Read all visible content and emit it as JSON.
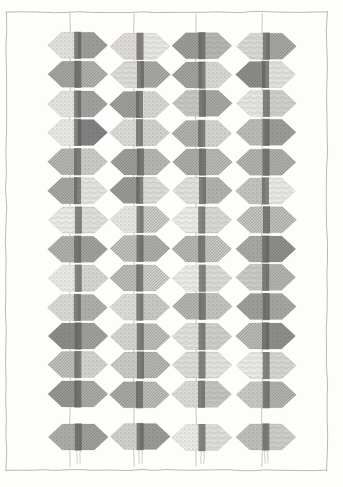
{
  "figure": {
    "background_color": "#fdfdfc",
    "frame_color": "#b9b9b5",
    "column_line_color": "#cfcfca",
    "spine_color": "#5c5c5c",
    "rows": 14,
    "columns": 4,
    "frame": {
      "left": 6,
      "top": 12,
      "right": 327,
      "bottom": 470
    },
    "column_x": [
      78,
      140,
      202,
      266
    ],
    "column_line_x": [
      70,
      134,
      196,
      262
    ],
    "row_y": [
      46,
      75,
      104,
      133,
      162,
      191,
      220,
      249,
      278,
      307,
      336,
      365,
      394,
      437
    ],
    "hex_width": 60,
    "hex_height": 26,
    "hex_notch": 14,
    "spine_width": 7
  },
  "chart_data": {
    "type": "heatmap",
    "xlabel": "",
    "ylabel": "",
    "columns": [
      "C1",
      "C2",
      "C3",
      "C4"
    ],
    "rows": [
      "R1",
      "R2",
      "R3",
      "R4",
      "R5",
      "R6",
      "R7",
      "R8",
      "R9",
      "R10",
      "R11",
      "R12",
      "R13",
      "R14"
    ],
    "legend": [],
    "grid": true,
    "note": "Each cell is a hexagonal block split into a left half and a right half; each half has its own grey tone and stipple/hatch texture. A dark vertical spine runs down the middle of every block.",
    "cells": [
      [
        {
          "left_tone": "#e0e0dd",
          "right_tone": "#9b9b98",
          "left_tex": "stipple",
          "right_tex": "stipple"
        },
        {
          "left_tone": "#dedbd6",
          "right_tone": "#e8e8e5",
          "left_tex": "stipple",
          "right_tex": "wave"
        },
        {
          "left_tone": "#9d9d9a",
          "right_tone": "#b5b5b1",
          "left_tex": "hatch",
          "right_tex": "wave"
        },
        {
          "left_tone": "#d9d9d5",
          "right_tone": "#a7a7a3",
          "left_tex": "wave",
          "right_tex": "hatch"
        }
      ],
      [
        {
          "left_tone": "#a5a5a1",
          "right_tone": "#b0b0ac",
          "left_tex": "hatch",
          "right_tex": "hatch"
        },
        {
          "left_tone": "#dcdcd8",
          "right_tone": "#a9a9a5",
          "left_tex": "wave",
          "right_tex": "hatch"
        },
        {
          "left_tone": "#a3a3a0",
          "right_tone": "#d6d6d2",
          "left_tex": "hatch",
          "right_tex": "stipple"
        },
        {
          "left_tone": "#8d8d8a",
          "right_tone": "#e2e2df",
          "left_tex": "hatch",
          "right_tex": "wave"
        }
      ],
      [
        {
          "left_tone": "#e3e3e0",
          "right_tone": "#a0a09d",
          "left_tex": "stipple",
          "right_tex": "stipple"
        },
        {
          "left_tone": "#9f9f9b",
          "right_tone": "#d5d5d1",
          "left_tex": "hatch",
          "right_tex": "stipple"
        },
        {
          "left_tone": "#c6c6c2",
          "right_tone": "#a8a8a4",
          "left_tex": "wave",
          "right_tex": "hatch"
        },
        {
          "left_tone": "#e6e6e3",
          "right_tone": "#cfcfcb",
          "left_tex": "wave",
          "right_tex": "wave"
        }
      ],
      [
        {
          "left_tone": "#e7e7e4",
          "right_tone": "#808080",
          "left_tex": "stipple",
          "right_tex": "stipple"
        },
        {
          "left_tone": "#dadad6",
          "right_tone": "#d0d0cc",
          "left_tex": "stipple",
          "right_tex": "stipple"
        },
        {
          "left_tone": "#b2b2ae",
          "right_tone": "#d2d2ce",
          "left_tex": "hatch",
          "right_tex": "stipple"
        },
        {
          "left_tone": "#b8b8b4",
          "right_tone": "#9a9a97",
          "left_tex": "stipple",
          "right_tex": "stipple"
        }
      ],
      [
        {
          "left_tone": "#b6b6b2",
          "right_tone": "#c9c9c5",
          "left_tex": "hatch",
          "right_tex": "stipple"
        },
        {
          "left_tone": "#9e9e9b",
          "right_tone": "#b4b4b0",
          "left_tex": "hatch",
          "right_tex": "stipple"
        },
        {
          "left_tone": "#adadaa",
          "right_tone": "#b9b9b5",
          "left_tex": "hatch",
          "right_tex": "hatch"
        },
        {
          "left_tone": "#b3b3af",
          "right_tone": "#aeaeaa",
          "left_tex": "hatch",
          "right_tex": "hatch"
        }
      ],
      [
        {
          "left_tone": "#a8a8a4",
          "right_tone": "#e4e4e1",
          "left_tex": "hatch",
          "right_tex": "wave"
        },
        {
          "left_tone": "#9a9a97",
          "right_tone": "#dcdcd8",
          "left_tex": "hatch",
          "right_tex": "wave"
        },
        {
          "left_tone": "#e1e1de",
          "right_tone": "#b0b0ac",
          "left_tex": "wave",
          "right_tex": "stipple"
        },
        {
          "left_tone": "#c2c2be",
          "right_tone": "#e9e9e6",
          "left_tex": "stipple",
          "right_tex": "wave"
        }
      ],
      [
        {
          "left_tone": "#eaeae7",
          "right_tone": "#dfdfdc",
          "left_tex": "wave",
          "right_tex": "wave"
        },
        {
          "left_tone": "#e5e5e2",
          "right_tone": "#cbcbc7",
          "left_tex": "stipple",
          "right_tex": "hatch"
        },
        {
          "left_tone": "#ececea",
          "right_tone": "#d8d8d4",
          "left_tex": "wave",
          "right_tex": "wave"
        },
        {
          "left_tone": "#c4c4c0",
          "right_tone": "#bebeba",
          "left_tex": "hatch",
          "right_tex": "hatch"
        }
      ],
      [
        {
          "left_tone": "#b1b1ad",
          "right_tone": "#a2a29f",
          "left_tex": "hatch",
          "right_tex": "hatch"
        },
        {
          "left_tone": "#c0c0bc",
          "right_tone": "#aeaeaa",
          "left_tex": "hatch",
          "right_tex": "hatch"
        },
        {
          "left_tone": "#b7b7b3",
          "right_tone": "#c5c5c1",
          "left_tex": "hatch",
          "right_tex": "hatch"
        },
        {
          "left_tone": "#a6a6a2",
          "right_tone": "#8f8f8c",
          "left_tex": "stipple",
          "right_tex": "hatch"
        }
      ],
      [
        {
          "left_tone": "#e8e8e5",
          "right_tone": "#d4d4d0",
          "left_tex": "stipple",
          "right_tex": "stipple"
        },
        {
          "left_tone": "#bcbcb8",
          "right_tone": "#cdcdc9",
          "left_tex": "hatch",
          "right_tex": "hatch"
        },
        {
          "left_tone": "#ebebe8",
          "right_tone": "#dadad7",
          "left_tex": "wave",
          "right_tex": "wave"
        },
        {
          "left_tone": "#cacac6",
          "right_tone": "#b4b4b0",
          "left_tex": "wave",
          "right_tex": "hatch"
        }
      ],
      [
        {
          "left_tone": "#d7d7d3",
          "right_tone": "#adadaa",
          "left_tex": "stipple",
          "right_tex": "stipple"
        },
        {
          "left_tone": "#dbdbd7",
          "right_tone": "#c7c7c3",
          "left_tex": "stipple",
          "right_tex": "stipple"
        },
        {
          "left_tone": "#b5b5b1",
          "right_tone": "#c1c1bd",
          "left_tex": "hatch",
          "right_tex": "stipple"
        },
        {
          "left_tone": "#9c9c99",
          "right_tone": "#a4a4a1",
          "left_tex": "stipple",
          "right_tex": "stipple"
        }
      ],
      [
        {
          "left_tone": "#8a8a87",
          "right_tone": "#a1a19e",
          "left_tex": "stipple",
          "right_tex": "hatch"
        },
        {
          "left_tone": "#d3d3cf",
          "right_tone": "#bdbdb9",
          "left_tex": "stipple",
          "right_tex": "hatch"
        },
        {
          "left_tone": "#e0e0dd",
          "right_tone": "#cececa",
          "left_tex": "wave",
          "right_tex": "wave"
        },
        {
          "left_tone": "#b9b9b5",
          "right_tone": "#8c8c89",
          "left_tex": "hatch",
          "right_tex": "stipple"
        }
      ],
      [
        {
          "left_tone": "#bfbfbb",
          "right_tone": "#d1d1cd",
          "left_tex": "hatch",
          "right_tex": "stipple"
        },
        {
          "left_tone": "#c8c8c4",
          "right_tone": "#b6b6b2",
          "left_tex": "stipple",
          "right_tex": "hatch"
        },
        {
          "left_tone": "#dddddA",
          "right_tone": "#e3e3e0",
          "left_tex": "wave",
          "right_tex": "wave"
        },
        {
          "left_tone": "#eaeae7",
          "right_tone": "#d5d5d1",
          "left_tex": "wave",
          "right_tex": "wave"
        }
      ],
      [
        {
          "left_tone": "#9696 93",
          "right_tone": "#abab a7",
          "left_tex": "hatch",
          "right_tex": "hatch"
        },
        {
          "left_tone": "#a9a9a5",
          "right_tone": "#bbbbb7",
          "left_tex": "hatch",
          "right_tex": "hatch"
        },
        {
          "left_tone": "#d9d9d6",
          "right_tone": "#c3c3bf",
          "left_tex": "stipple",
          "right_tex": "wave"
        },
        {
          "left_tone": "#c6c6c2",
          "right_tone": "#b2b2ae",
          "left_tex": "stipple",
          "right_tex": "hatch"
        }
      ],
      [
        {
          "left_tone": "#ababa7",
          "right_tone": "#a0a09d",
          "left_tex": "stipple",
          "right_tex": "hatch"
        },
        {
          "left_tone": "#cfcfcb",
          "right_tone": "#9898 95",
          "left_tex": "stipple",
          "right_tex": "stipple"
        },
        {
          "left_tone": "#e9e9e6",
          "right_tone": "#dededb",
          "left_tex": "stipple",
          "right_tex": "wave"
        },
        {
          "left_tone": "#bdbdb9",
          "right_tone": "#cdcdc9",
          "left_tex": "stipple",
          "right_tex": "wave"
        }
      ]
    ]
  }
}
